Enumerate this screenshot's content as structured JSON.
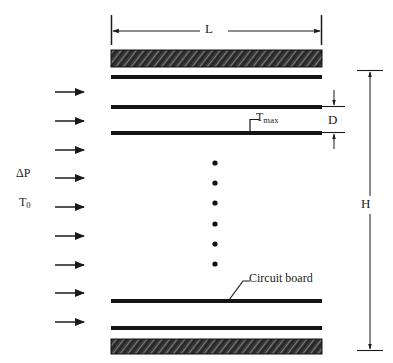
{
  "figure": {
    "type": "engineering-schematic",
    "background_color": "#ffffff",
    "line_color": "#1a1a1a",
    "hatch_color": "#4a4a4a"
  },
  "labels": {
    "length": "L",
    "spacing": "D",
    "height": "H",
    "max_temperature": {
      "base": "T",
      "sub": "max"
    },
    "pressure_drop": {
      "base": "ΔP",
      "sub": ""
    },
    "inlet_temperature": {
      "base": "T",
      "sub": "0"
    },
    "circuit_board": "Circuit board"
  },
  "dimensions": {
    "L": {
      "label": "L",
      "orientation": "horizontal",
      "x_start": 111,
      "x_end": 322,
      "y": 31
    },
    "D": {
      "label": "D",
      "orientation": "vertical",
      "x": 334,
      "y_start": 106,
      "y_end": 131
    },
    "H": {
      "label": "H",
      "orientation": "vertical",
      "x": 370,
      "y_start": 70,
      "y_end": 350
    }
  },
  "boards": [
    {
      "name": "top-hatched-plate",
      "style": "hatched",
      "x": 111,
      "y": 50,
      "width": 211,
      "height": 17
    },
    {
      "name": "circuit-board-1",
      "style": "solid",
      "x": 111,
      "y": 75,
      "width": 211,
      "height": 4
    },
    {
      "name": "circuit-board-2",
      "style": "solid",
      "x": 111,
      "y": 105,
      "width": 211,
      "height": 4
    },
    {
      "name": "circuit-board-3",
      "style": "solid",
      "x": 111,
      "y": 131,
      "width": 211,
      "height": 4
    },
    {
      "name": "circuit-board-4",
      "style": "solid",
      "x": 111,
      "y": 299,
      "width": 211,
      "height": 4
    },
    {
      "name": "circuit-board-5",
      "style": "solid",
      "x": 111,
      "y": 326,
      "width": 211,
      "height": 4
    },
    {
      "name": "bottom-hatched-plate",
      "style": "hatched",
      "x": 111,
      "y": 339,
      "width": 211,
      "height": 15
    }
  ],
  "ellipsis_dots": {
    "count": 6,
    "x": 215,
    "y_values": [
      163,
      183,
      203,
      224,
      244,
      264
    ],
    "radius": 2.6
  },
  "flow_arrows": {
    "count": 9,
    "x_start": 55,
    "x_end": 86,
    "y_values": [
      92,
      121,
      150,
      178,
      207,
      236,
      265,
      293,
      322
    ]
  },
  "leaders": {
    "tmax": {
      "from_x": 250,
      "from_y": 133,
      "elbow_x": 250,
      "elbow_y": 120,
      "to_x": 258,
      "to_y": 120
    },
    "circuit_board": {
      "from_x": 229,
      "from_y": 299,
      "to_x": 246,
      "to_y": 281
    }
  }
}
